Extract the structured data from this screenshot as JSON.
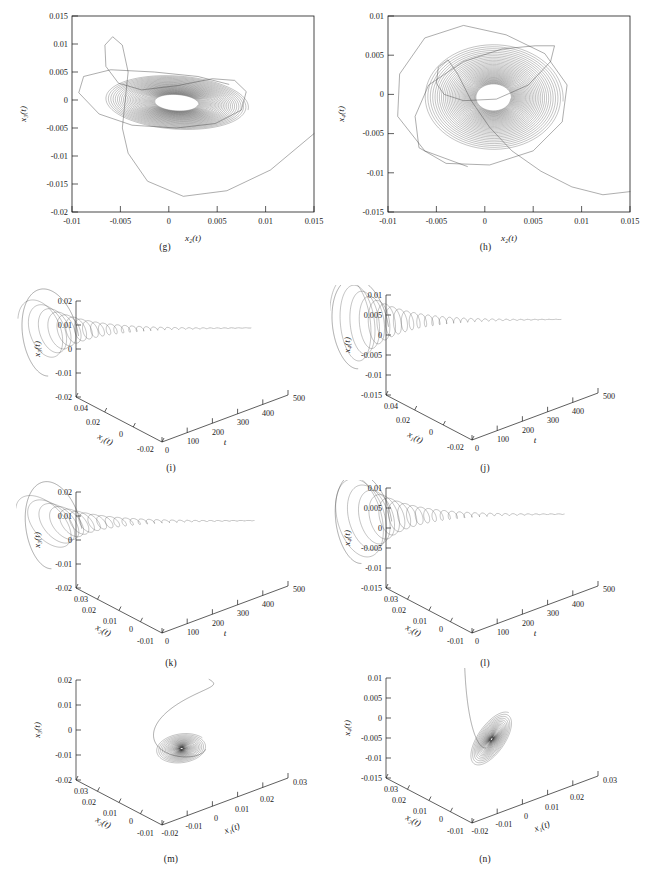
{
  "figure": {
    "kind": "multi-panel phase-portrait figure",
    "panel_count": 8,
    "line_color": "#3d3d3d",
    "background": "#ffffff"
  },
  "panels": [
    {
      "id": "g",
      "caption": "(g)",
      "type": "2d",
      "chart_type": "line",
      "xlabel": "x₂(t)",
      "ylabel": "x₃(t)",
      "xticks": [
        "-0.01",
        "-0.005",
        "0",
        "0.005",
        "0.01",
        "0.015"
      ],
      "xtick_values": [
        -0.01,
        -0.005,
        0,
        0.005,
        0.01,
        0.015
      ],
      "yticks": [
        "0.015",
        "0.01",
        "0.005",
        "0",
        "-0.005",
        "-0.01",
        "-0.015",
        "-0.02"
      ],
      "ytick_values": [
        0.015,
        0.01,
        0.005,
        0,
        -0.005,
        -0.01,
        -0.015,
        -0.02
      ],
      "xlim": [
        -0.01,
        0.015
      ],
      "ylim": [
        -0.02,
        0.015
      ],
      "grid": false,
      "description": "Damped spiral attractor converging to a dense core near (0.001, 0) with a long transient excursion dipping to x3 = -0.017 and exiting to the right edge."
    },
    {
      "id": "h",
      "caption": "(h)",
      "type": "2d",
      "chart_type": "line",
      "xlabel": "x₂(t)",
      "ylabel": "x₄(t)",
      "xticks": [
        "-0.01",
        "-0.005",
        "0",
        "0.005",
        "0.01",
        "0.015"
      ],
      "xtick_values": [
        -0.01,
        -0.005,
        0,
        0.005,
        0.01,
        0.015
      ],
      "yticks": [
        "0.01",
        "0.005",
        "0",
        "-0.005",
        "-0.01",
        "-0.015"
      ],
      "ytick_values": [
        0.01,
        0.005,
        0,
        -0.005,
        -0.01,
        -0.015
      ],
      "xlim": [
        -0.01,
        0.015
      ],
      "ylim": [
        -0.015,
        0.01
      ],
      "grid": false,
      "description": "Nearly circular nested spiral converging to a dense core at the origin, outer loop reaching x4 = 0.009, with a transient sweeping down to x4 = -0.0128 toward the right edge."
    },
    {
      "id": "i",
      "caption": "(i)",
      "type": "3d",
      "chart_type": "line",
      "vaxis_label": "x₃(t)",
      "depth_axis_label": "x₁(t)",
      "horiz_axis_label": "t",
      "vticks": [
        "0.02",
        "0.01",
        "0",
        "-0.01",
        "-0.02"
      ],
      "vtick_values": [
        0.02,
        0.01,
        0,
        -0.01,
        -0.02
      ],
      "depth_ticks": [
        "0.04",
        "0.02",
        "0",
        "-0.02"
      ],
      "depth_tick_values": [
        0.04,
        0.02,
        0,
        -0.02
      ],
      "horiz_ticks": [
        "0",
        "100",
        "200",
        "300",
        "400",
        "500"
      ],
      "horiz_tick_values": [
        0,
        100,
        200,
        300,
        400,
        500
      ],
      "description": "Time-evolution funnel: oscillation amplitude decays with t, forming a cone that narrows toward large t; a wide transient loop sits at small t."
    },
    {
      "id": "j",
      "caption": "(j)",
      "type": "3d",
      "chart_type": "line",
      "vaxis_label": "x₄(t)",
      "depth_axis_label": "x₁(t)",
      "horiz_axis_label": "t",
      "vticks": [
        "0.01",
        "0.005",
        "0",
        "-0.005",
        "-0.01",
        "-0.015"
      ],
      "vtick_values": [
        0.01,
        0.005,
        0,
        -0.005,
        -0.01,
        -0.015
      ],
      "depth_ticks": [
        "0.04",
        "0.02",
        "0",
        "-0.02"
      ],
      "depth_tick_values": [
        0.04,
        0.02,
        0,
        -0.02
      ],
      "horiz_ticks": [
        "0",
        "100",
        "200",
        "300",
        "400",
        "500"
      ],
      "horiz_tick_values": [
        0,
        100,
        200,
        300,
        400,
        500
      ],
      "description": "Decaying oscillation funnel in x4 versus t and x1, with a broad transient loop near t = 0 and a thin tail extending to t = 500."
    },
    {
      "id": "k",
      "caption": "(k)",
      "type": "3d",
      "chart_type": "line",
      "vaxis_label": "x₃(t)",
      "depth_axis_label": "x₂(t)",
      "horiz_axis_label": "t",
      "vticks": [
        "0.02",
        "0.01",
        "0",
        "-0.01",
        "-0.02"
      ],
      "vtick_values": [
        0.02,
        0.01,
        0,
        -0.01,
        -0.02
      ],
      "depth_ticks": [
        "0.03",
        "0.02",
        "0.01",
        "0",
        "-0.01"
      ],
      "depth_tick_values": [
        0.03,
        0.02,
        0.01,
        0,
        -0.01
      ],
      "horiz_ticks": [
        "0",
        "100",
        "200",
        "300",
        "400",
        "500"
      ],
      "horiz_tick_values": [
        0,
        100,
        200,
        300,
        400,
        500
      ],
      "description": "x3 versus x2 and t: contracting spiral funnel with a large swinging transient arc starting above the funnel."
    },
    {
      "id": "l",
      "caption": "(l)",
      "type": "3d",
      "chart_type": "line",
      "vaxis_label": "x₄(t)",
      "depth_axis_label": "x₂(t)",
      "horiz_axis_label": "t",
      "vticks": [
        "0.01",
        "0.005",
        "0",
        "-0.005",
        "-0.01",
        "-0.015"
      ],
      "vtick_values": [
        0.01,
        0.005,
        0,
        -0.005,
        -0.01,
        -0.015
      ],
      "depth_ticks": [
        "0.03",
        "0.02",
        "0.01",
        "0",
        "-0.01"
      ],
      "depth_tick_values": [
        0.03,
        0.02,
        0.01,
        0,
        -0.01
      ],
      "horiz_ticks": [
        "0",
        "100",
        "200",
        "300",
        "400",
        "500"
      ],
      "horiz_tick_values": [
        0,
        100,
        200,
        300,
        400,
        500
      ],
      "description": "x4 versus x2 and t: nested elliptical rings at low t collapsing into a narrow horn that tapers toward t = 500."
    },
    {
      "id": "m",
      "caption": "(m)",
      "type": "3d-xyz",
      "chart_type": "line",
      "vaxis_label": "x₃(t)",
      "depth_axis_label": "x₂(t)",
      "horiz_axis_label": "x₁(t)",
      "vticks": [
        "0.02",
        "0.01",
        "0",
        "-0.01",
        "-0.02"
      ],
      "vtick_values": [
        0.02,
        0.01,
        0,
        -0.01,
        -0.02
      ],
      "depth_ticks": [
        "0.03",
        "0.02",
        "0.01",
        "0",
        "-0.01"
      ],
      "depth_tick_values": [
        0.03,
        0.02,
        0.01,
        0,
        -0.01
      ],
      "horiz_ticks": [
        "-0.02",
        "-0.01",
        "0",
        "0.01",
        "0.02",
        "0.03"
      ],
      "horiz_tick_values": [
        -0.02,
        -0.01,
        0,
        0.01,
        0.02,
        0.03
      ],
      "description": "Three-state phase portrait: flat dense disc-shaped attractor centred near x3 = -0.007 with a tall transient loop entering from above."
    },
    {
      "id": "n",
      "caption": "(n)",
      "type": "3d-xyz",
      "chart_type": "line",
      "vaxis_label": "x₄(t)",
      "depth_axis_label": "x₂(t)",
      "horiz_axis_label": "x₁(t)",
      "vticks": [
        "0.01",
        "0.005",
        "0",
        "-0.005",
        "-0.01",
        "-0.015"
      ],
      "vtick_values": [
        0.01,
        0.005,
        0,
        -0.005,
        -0.01,
        -0.015
      ],
      "depth_ticks": [
        "0.03",
        "0.02",
        "0.01",
        "0",
        "-0.01"
      ],
      "depth_tick_values": [
        0.03,
        0.02,
        0.01,
        0,
        -0.01
      ],
      "horiz_ticks": [
        "-0.02",
        "-0.01",
        "0",
        "0.01",
        "0.02",
        "0.03"
      ],
      "horiz_tick_values": [
        -0.02,
        -0.01,
        0,
        0.01,
        0.02,
        0.03
      ],
      "description": "Compact ball-shaped dense attractor centred near x4 = -0.005 with a straight transient streak entering from the upper left."
    }
  ],
  "chart_data": [
    {
      "type": "line",
      "panel": "g",
      "title": "(g)",
      "xlabel": "x2(t)",
      "ylabel": "x3(t)",
      "xlim": [
        -0.01,
        0.015
      ],
      "ylim": [
        -0.02,
        0.015
      ],
      "xticks": [
        -0.01,
        -0.005,
        0,
        0.005,
        0.01,
        0.015
      ],
      "yticks": [
        0.015,
        0.01,
        0.005,
        0,
        -0.005,
        -0.01,
        -0.015,
        -0.02
      ],
      "grid": false,
      "legend": null,
      "series": [
        {
          "name": "trajectory",
          "kind": "decaying-spiral",
          "center": [
            0.0008,
            -0.0005
          ],
          "r_start_x": 0.0075,
          "r_start_y": 0.0048,
          "decay": 0.965,
          "turns": 34,
          "tilt_deg": -10
        },
        {
          "name": "transient",
          "points": [
            [
              0.015,
              -0.006
            ],
            [
              0.0105,
              -0.0125
            ],
            [
              0.006,
              -0.0162
            ],
            [
              0.0015,
              -0.0172
            ],
            [
              -0.0022,
              -0.0145
            ],
            [
              -0.0042,
              -0.0095
            ],
            [
              -0.0048,
              -0.005
            ],
            [
              -0.0045,
              0.0
            ],
            [
              -0.0042,
              0.005
            ],
            [
              -0.0048,
              0.0098
            ],
            [
              -0.0058,
              0.0113
            ],
            [
              -0.0066,
              0.0098
            ],
            [
              -0.0065,
              0.006
            ],
            [
              -0.0052,
              0.003
            ],
            [
              -0.0028,
              0.0018
            ],
            [
              0.001,
              0.0026
            ],
            [
              0.0045,
              0.0038
            ],
            [
              0.0068,
              0.0035
            ],
            [
              0.008,
              0.0015
            ],
            [
              0.0075,
              -0.0018
            ],
            [
              0.0048,
              -0.0042
            ],
            [
              0.0008,
              -0.005
            ],
            [
              -0.0038,
              -0.0045
            ],
            [
              -0.0072,
              -0.0025
            ],
            [
              -0.0093,
              0.0013
            ],
            [
              -0.0088,
              0.0042
            ],
            [
              -0.006,
              0.0054
            ],
            [
              -0.0015,
              0.005
            ],
            [
              0.003,
              0.0042
            ],
            [
              0.0062,
              0.0028
            ]
          ]
        }
      ]
    },
    {
      "type": "line",
      "panel": "h",
      "title": "(h)",
      "xlabel": "x2(t)",
      "ylabel": "x4(t)",
      "xlim": [
        -0.01,
        0.015
      ],
      "ylim": [
        -0.015,
        0.01
      ],
      "xticks": [
        -0.01,
        -0.005,
        0,
        0.005,
        0.01,
        0.015
      ],
      "yticks": [
        0.01,
        0.005,
        0,
        -0.005,
        -0.01,
        -0.015
      ],
      "grid": false,
      "legend": null,
      "series": [
        {
          "name": "trajectory",
          "kind": "decaying-spiral",
          "center": [
            0.0009,
            -0.0004
          ],
          "r_start_x": 0.0072,
          "r_start_y": 0.0068,
          "decay": 0.962,
          "turns": 36,
          "tilt_deg": -4
        },
        {
          "name": "transient",
          "points": [
            [
              0.015,
              -0.0124
            ],
            [
              0.0122,
              -0.0128
            ],
            [
              0.009,
              -0.0118
            ],
            [
              0.0058,
              -0.0098
            ],
            [
              0.0028,
              -0.0072
            ],
            [
              0.0005,
              -0.0042
            ],
            [
              -0.0014,
              -0.0008
            ],
            [
              -0.0028,
              0.0026
            ],
            [
              -0.0038,
              0.0044
            ],
            [
              -0.0048,
              0.0035
            ],
            [
              -0.005,
              0.0014
            ],
            [
              -0.0042,
              0.0
            ],
            [
              -0.0022,
              -0.0008
            ],
            [
              0.0012,
              -0.0006
            ],
            [
              0.0045,
              0.0012
            ],
            [
              0.0068,
              0.0042
            ],
            [
              0.0072,
              0.0062
            ],
            [
              0.0052,
              0.0062
            ],
            [
              0.0018,
              0.0058
            ],
            [
              -0.0022,
              0.0042
            ],
            [
              -0.0058,
              0.0012
            ],
            [
              -0.0072,
              -0.0028
            ],
            [
              -0.0068,
              -0.0068
            ],
            [
              -0.004,
              -0.0088
            ],
            [
              0.0005,
              -0.009
            ],
            [
              0.005,
              -0.0072
            ],
            [
              0.008,
              -0.0035
            ],
            [
              0.0085,
              0.0012
            ],
            [
              0.0062,
              0.0052
            ],
            [
              0.0022,
              0.0076
            ],
            [
              -0.0022,
              0.0088
            ],
            [
              -0.0062,
              0.0072
            ],
            [
              -0.0088,
              0.0026
            ],
            [
              -0.009,
              -0.0028
            ],
            [
              -0.0062,
              -0.0072
            ],
            [
              -0.0018,
              -0.0092
            ]
          ]
        }
      ]
    },
    {
      "type": "line",
      "panel": "i",
      "title": "(i)",
      "axes": [
        "t",
        "x1(t)",
        "x3(t)"
      ],
      "tlim": [
        0,
        500
      ],
      "x1lim": [
        -0.02,
        0.04
      ],
      "x3lim": [
        -0.02,
        0.02
      ],
      "description_values": {
        "envelope_start": 0.012,
        "envelope_decay_tau": 95,
        "oscillation_periods": 30
      },
      "grid": false
    },
    {
      "type": "line",
      "panel": "j",
      "title": "(j)",
      "axes": [
        "t",
        "x1(t)",
        "x4(t)"
      ],
      "tlim": [
        0,
        500
      ],
      "x1lim": [
        -0.02,
        0.04
      ],
      "x4lim": [
        -0.015,
        0.01
      ],
      "description_values": {
        "envelope_start": 0.011,
        "envelope_decay_tau": 90,
        "oscillation_periods": 30
      },
      "grid": false
    },
    {
      "type": "line",
      "panel": "k",
      "title": "(k)",
      "axes": [
        "t",
        "x2(t)",
        "x3(t)"
      ],
      "tlim": [
        0,
        500
      ],
      "x2lim": [
        -0.01,
        0.03
      ],
      "x3lim": [
        -0.02,
        0.02
      ],
      "description_values": {
        "envelope_start": 0.01,
        "envelope_decay_tau": 100,
        "oscillation_periods": 28
      },
      "grid": false
    },
    {
      "type": "line",
      "panel": "l",
      "title": "(l)",
      "axes": [
        "t",
        "x2(t)",
        "x4(t)"
      ],
      "tlim": [
        0,
        500
      ],
      "x2lim": [
        -0.01,
        0.03
      ],
      "x4lim": [
        -0.015,
        0.01
      ],
      "description_values": {
        "envelope_start": 0.011,
        "envelope_decay_tau": 95,
        "oscillation_periods": 28
      },
      "grid": false
    },
    {
      "type": "line",
      "panel": "m",
      "title": "(m)",
      "axes": [
        "x1(t)",
        "x2(t)",
        "x3(t)"
      ],
      "x1lim": [
        -0.02,
        0.03
      ],
      "x2lim": [
        -0.01,
        0.03
      ],
      "x3lim": [
        -0.02,
        0.02
      ],
      "grid": false
    },
    {
      "type": "line",
      "panel": "n",
      "title": "(n)",
      "axes": [
        "x1(t)",
        "x2(t)",
        "x4(t)"
      ],
      "x1lim": [
        -0.02,
        0.03
      ],
      "x2lim": [
        -0.01,
        0.03
      ],
      "x4lim": [
        -0.015,
        0.01
      ],
      "grid": false
    }
  ]
}
